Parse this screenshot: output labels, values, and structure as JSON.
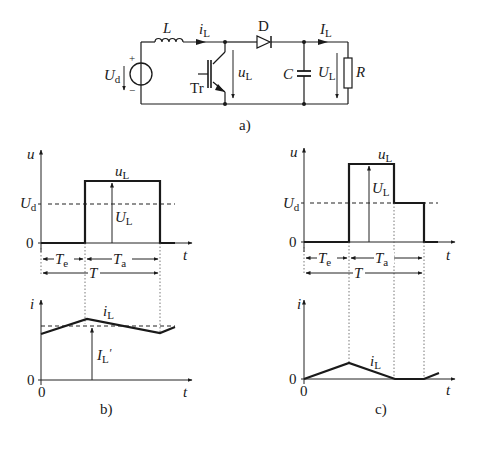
{
  "circuit": {
    "caption": "a)",
    "source_label": "U",
    "source_sub": "d",
    "source_plus": "+",
    "source_minus": "−",
    "inductor_label": "L",
    "current_label": "i",
    "current_sub": "L",
    "diode_label": "D",
    "transistor_label": "Tr",
    "switch_voltage_label": "u",
    "switch_voltage_sub": "L",
    "output_current_label": "I",
    "output_current_sub": "L",
    "capacitor_label": "C",
    "output_voltage_label": "U",
    "output_voltage_sub": "L",
    "resistor_label": "R"
  },
  "plot_b": {
    "caption": "b)",
    "upper": {
      "y_axis": "u",
      "x_axis": "t",
      "zero": "0",
      "ud_label": "U",
      "ud_sub": "d",
      "curve_label": "u",
      "curve_sub": "L",
      "arrow_label": "U",
      "arrow_sub": "L",
      "te_label": "T",
      "te_sub": "e",
      "ta_label": "T",
      "ta_sub": "a",
      "period_label": "T"
    },
    "lower": {
      "y_axis": "i",
      "x_axis": "t",
      "zero_y": "0",
      "zero_x": "0",
      "curve_label": "i",
      "curve_sub": "L",
      "avg_label": "I",
      "avg_sub": "L",
      "avg_prime": "′"
    }
  },
  "plot_c": {
    "caption": "c)",
    "upper": {
      "y_axis": "u",
      "x_axis": "t",
      "zero": "0",
      "ud_label": "U",
      "ud_sub": "d",
      "curve_label": "u",
      "curve_sub": "L",
      "arrow_label": "U",
      "arrow_sub": "L",
      "te_label": "T",
      "te_sub": "e",
      "ta_label": "T",
      "ta_sub": "a",
      "period_label": "T"
    },
    "lower": {
      "y_axis": "i",
      "x_axis": "t",
      "zero_y": "0",
      "zero_x": "0",
      "curve_label": "i",
      "curve_sub": "L"
    }
  }
}
